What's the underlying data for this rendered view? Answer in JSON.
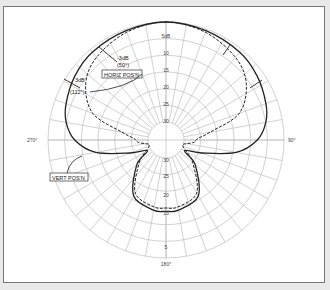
{
  "chart_data": {
    "type": "polar",
    "title": "",
    "center": [
      166,
      140
    ],
    "outer_radius": 118,
    "radial_unit": "dB",
    "radial_ticks": [
      {
        "db": 5,
        "label": "5dB"
      },
      {
        "db": 10,
        "label": "10"
      },
      {
        "db": 15,
        "label": "15"
      },
      {
        "db": 20,
        "label": "20"
      },
      {
        "db": 25,
        "label": "25"
      },
      {
        "db": 30,
        "label": "30"
      }
    ],
    "lower_radial_ticks": [
      "30",
      "25",
      "20",
      "15",
      "5"
    ],
    "angle_labels": [
      {
        "angle": 90,
        "label": "90°"
      },
      {
        "angle": 180,
        "label": "180°"
      },
      {
        "angle": 270,
        "label": "270°"
      }
    ],
    "grid": {
      "angular_step_deg": 10,
      "rings_db": [
        0,
        5,
        10,
        15,
        20,
        25,
        30
      ]
    },
    "series": [
      {
        "name": "HORIZ POS'N",
        "style": "dashed",
        "points_deg_db": [
          [
            0,
            0
          ],
          [
            20,
            -1
          ],
          [
            40,
            -3
          ],
          [
            55,
            -6
          ],
          [
            70,
            -12
          ],
          [
            80,
            -22
          ],
          [
            88,
            -26
          ],
          [
            95,
            -27
          ],
          [
            100,
            -29
          ],
          [
            110,
            -30
          ],
          [
            130,
            -25
          ],
          [
            150,
            -17
          ],
          [
            170,
            -15
          ],
          [
            180,
            -15
          ],
          [
            190,
            -15
          ],
          [
            210,
            -17
          ],
          [
            230,
            -25
          ],
          [
            250,
            -30
          ],
          [
            260,
            -29
          ],
          [
            265,
            -27
          ],
          [
            272,
            -26
          ],
          [
            280,
            -22
          ],
          [
            290,
            -12
          ],
          [
            305,
            -6
          ],
          [
            320,
            -3
          ],
          [
            340,
            -1
          ],
          [
            360,
            0
          ]
        ]
      },
      {
        "name": "VERT POS'N",
        "style": "solid",
        "points_deg_db": [
          [
            0,
            0
          ],
          [
            20,
            -0.5
          ],
          [
            40,
            -1
          ],
          [
            55,
            -2
          ],
          [
            70,
            -3.5
          ],
          [
            80,
            -5
          ],
          [
            90,
            -8
          ],
          [
            100,
            -14
          ],
          [
            110,
            -24
          ],
          [
            120,
            -29
          ],
          [
            130,
            -24
          ],
          [
            150,
            -16
          ],
          [
            170,
            -14
          ],
          [
            180,
            -14
          ],
          [
            190,
            -14
          ],
          [
            210,
            -16
          ],
          [
            230,
            -24
          ],
          [
            240,
            -29
          ],
          [
            250,
            -24
          ],
          [
            260,
            -14
          ],
          [
            270,
            -8
          ],
          [
            280,
            -5
          ],
          [
            290,
            -3.5
          ],
          [
            305,
            -2
          ],
          [
            320,
            -1
          ],
          [
            340,
            -0.5
          ],
          [
            360,
            0
          ]
        ]
      }
    ],
    "annotations": [
      {
        "text": "-3dB",
        "subtext": "(50°)",
        "series": "HORIZ POS'N"
      },
      {
        "text": "3dB",
        "subtext": "(112°)",
        "series": "VERT POS'N"
      }
    ]
  },
  "labels": {
    "horiz": "HORIZ POS'N",
    "vert": "VERT POS'N",
    "ann1_main": "-3dB",
    "ann1_sub": "(50°)",
    "ann2_main": "3dB",
    "ann2_sub": "(112°)",
    "deg90": "90°",
    "deg180": "180°",
    "deg270": "270°",
    "r5": "5dB",
    "r10": "10",
    "r15": "15",
    "r20": "20",
    "r25": "25",
    "r30": "30",
    "l30": "30",
    "l25": "25",
    "l20": "20",
    "l15": "15",
    "l5": "5"
  }
}
